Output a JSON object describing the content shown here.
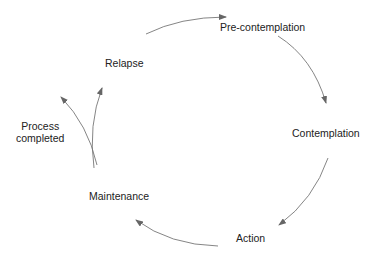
{
  "diagram": {
    "type": "cycle",
    "stages": [
      {
        "id": "pre-contemplation",
        "label": "Pre-contemplation"
      },
      {
        "id": "contemplation",
        "label": "Contemplation"
      },
      {
        "id": "action",
        "label": "Action"
      },
      {
        "id": "maintenance",
        "label": "Maintenance"
      },
      {
        "id": "relapse",
        "label": "Relapse"
      }
    ],
    "exit": {
      "label_line1": "Process",
      "label_line2": "completed"
    },
    "edges": [
      {
        "from": "relapse",
        "to": "pre-contemplation"
      },
      {
        "from": "pre-contemplation",
        "to": "contemplation"
      },
      {
        "from": "contemplation",
        "to": "action"
      },
      {
        "from": "action",
        "to": "maintenance"
      },
      {
        "from": "maintenance",
        "to": "relapse"
      },
      {
        "from": "maintenance",
        "to": "process-completed"
      }
    ],
    "colors": {
      "arrow": "#666666",
      "text": "#222222"
    }
  }
}
